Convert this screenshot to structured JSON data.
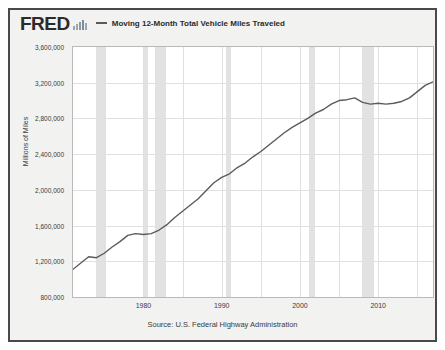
{
  "header": {
    "logo_text": "FRED",
    "logo_icon": "bar-chart-icon",
    "legend": [
      {
        "label": "Moving 12-Month Total Vehicle Miles Traveled",
        "color": "#5b5b5b"
      }
    ]
  },
  "source": "Source: U.S. Federal Highway Administration",
  "colors": {
    "line": "#5b5b5b",
    "recession_band": "#e2e2e2",
    "grid": "#e0e0e0",
    "plot_background": "#ffffff",
    "frame_background": "#f2f2f0",
    "frame_border": "#4a4a4a",
    "text": "#2b2b2b"
  },
  "chart_data": {
    "type": "line",
    "title": "Moving 12-Month Total Vehicle Miles Traveled",
    "xlabel": "",
    "ylabel": "Millions of Miles",
    "ylim": [
      800000,
      3600000
    ],
    "xlim": [
      1971,
      2017
    ],
    "grid": true,
    "legend_position": "top",
    "ytick_labels": [
      "3,600,000",
      "3,200,000",
      "2,800,000",
      "2,400,000",
      "2,000,000",
      "1,600,000",
      "1,200,000",
      "800,000"
    ],
    "ytick_values": [
      3600000,
      3200000,
      2800000,
      2400000,
      2000000,
      1600000,
      1200000,
      800000
    ],
    "xtick_labels": [
      "1980",
      "1990",
      "2000",
      "2010"
    ],
    "xtick_values": [
      1980,
      1990,
      2000,
      2010
    ],
    "series": [
      {
        "name": "Moving 12-Month Total Vehicle Miles Traveled",
        "color": "#5b5b5b",
        "x": [
          1971,
          1972,
          1973,
          1974,
          1975,
          1976,
          1977,
          1978,
          1979,
          1980,
          1981,
          1982,
          1983,
          1984,
          1985,
          1986,
          1987,
          1988,
          1989,
          1990,
          1991,
          1992,
          1993,
          1994,
          1995,
          1996,
          1997,
          1998,
          1999,
          2000,
          2001,
          2002,
          2003,
          2004,
          2005,
          2006,
          2007,
          2008,
          2009,
          2010,
          2011,
          2012,
          2013,
          2014,
          2015,
          2016,
          2017
        ],
        "values": [
          1110000,
          1180000,
          1250000,
          1240000,
          1290000,
          1360000,
          1420000,
          1490000,
          1510000,
          1500000,
          1510000,
          1550000,
          1610000,
          1690000,
          1760000,
          1830000,
          1900000,
          1990000,
          2080000,
          2140000,
          2180000,
          2250000,
          2300000,
          2370000,
          2430000,
          2500000,
          2570000,
          2640000,
          2700000,
          2750000,
          2800000,
          2860000,
          2900000,
          2960000,
          3000000,
          3010000,
          3030000,
          2980000,
          2960000,
          2970000,
          2960000,
          2970000,
          2990000,
          3030000,
          3100000,
          3170000,
          3210000
        ]
      }
    ],
    "recession_bands": [
      {
        "start": 1969.9,
        "end": 1970.9
      },
      {
        "start": 1973.9,
        "end": 1975.2
      },
      {
        "start": 1980.0,
        "end": 1980.6
      },
      {
        "start": 1981.5,
        "end": 1982.9
      },
      {
        "start": 1990.5,
        "end": 1991.2
      },
      {
        "start": 2001.2,
        "end": 2001.9
      },
      {
        "start": 2007.9,
        "end": 2009.5
      },
      {
        "start": 2019.9,
        "end": 2020.4
      }
    ]
  }
}
